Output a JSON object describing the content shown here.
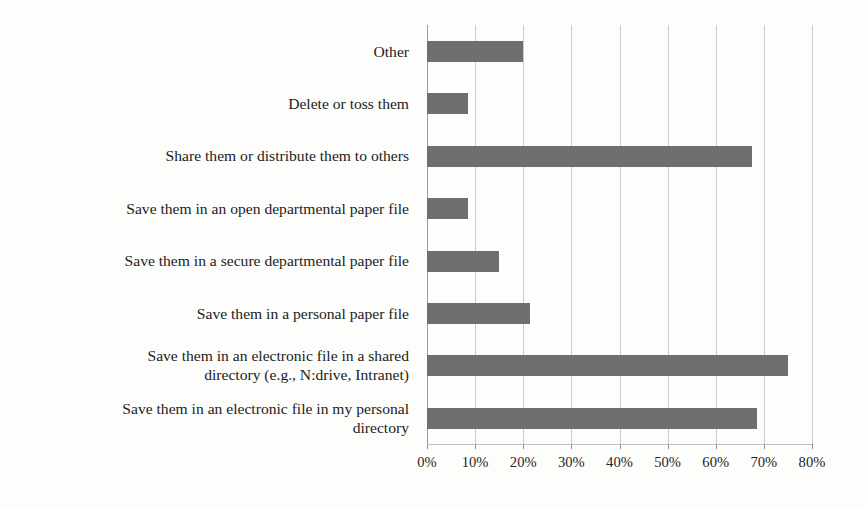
{
  "chart_data": {
    "type": "bar",
    "orientation": "horizontal",
    "title": "",
    "subtitle": "",
    "xlabel": "",
    "ylabel": "",
    "xlim": [
      0,
      80
    ],
    "xtick_labels": [
      "0%",
      "10%",
      "20%",
      "30%",
      "40%",
      "50%",
      "60%",
      "70%",
      "80%"
    ],
    "xtick_values": [
      0,
      10,
      20,
      30,
      40,
      50,
      60,
      70,
      80
    ],
    "grid": true,
    "legend": false,
    "bar_color": "#6f6f6f",
    "gridline_color": "#c9c9c9",
    "background_color": "#fdfdfb",
    "categories": [
      "Other",
      "Delete or toss them",
      "Share them or distribute them to others",
      "Save them in an open departmental paper file",
      "Save them in a secure departmental paper file",
      "Save them in a personal paper file",
      "Save them in an electronic file in a shared\ndirectory (e.g., N:drive, Intranet)",
      "Save them in an electronic file in my personal\ndirectory"
    ],
    "values": [
      20,
      8.5,
      67.5,
      8.5,
      15,
      21.5,
      75,
      68.5
    ]
  }
}
